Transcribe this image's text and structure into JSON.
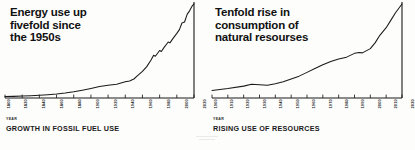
{
  "figure": {
    "background_color": "#fdfdfc",
    "ink_color": "#1a1a1a"
  },
  "chart_data": [
    {
      "type": "line",
      "id": "fossil-fuel-use",
      "title": "Energy use up\nfivefold since\nthe 1950s",
      "caption": "GROWTH IN FOSSIL FUEL USE",
      "xlabel": "YEAR",
      "ylabel": "",
      "grid": false,
      "legend": "none",
      "xlim": [
        1800,
        2020
      ],
      "ylim": [
        0,
        100
      ],
      "tick_labels": [
        "1800",
        "1820",
        "1840",
        "1860",
        "1880",
        "1900",
        "1920",
        "1940",
        "1960",
        "1980",
        "2000",
        "2020"
      ],
      "x": [
        1800,
        1810,
        1820,
        1830,
        1840,
        1850,
        1860,
        1870,
        1880,
        1890,
        1900,
        1910,
        1920,
        1930,
        1940,
        1945,
        1950,
        1955,
        1960,
        1965,
        1970,
        1973,
        1975,
        1980,
        1982,
        1985,
        1990,
        1992,
        1995,
        2000,
        2003,
        2006,
        2009,
        2012,
        2015,
        2018,
        2020
      ],
      "values": [
        1.5,
        1.7,
        2.0,
        2.4,
        2.9,
        3.5,
        4.3,
        5.3,
        6.6,
        8.2,
        10.0,
        12.0,
        13.5,
        14.5,
        17.0,
        18.0,
        20.0,
        24.0,
        28.0,
        33.0,
        40.0,
        45.0,
        44.0,
        50.0,
        49.0,
        53.0,
        59.0,
        58.0,
        62.0,
        68.0,
        72.0,
        79.0,
        80.0,
        88.0,
        92.0,
        97.0,
        99.0
      ]
    },
    {
      "type": "line",
      "id": "resource-use",
      "title": "Tenfold rise in\nconsumption of\nnatural resourses",
      "caption": "RISING USE OF RESOURCES",
      "xlabel": "YEAR",
      "ylabel": "",
      "grid": false,
      "legend": "none",
      "xlim": [
        1900,
        2020
      ],
      "ylim": [
        0,
        100
      ],
      "tick_labels": [
        "1900",
        "1910",
        "1920",
        "1930",
        "1940",
        "1950",
        "1960",
        "1970",
        "1980",
        "1990",
        "2000",
        "2010",
        "2020"
      ],
      "x": [
        1900,
        1910,
        1920,
        1925,
        1930,
        1935,
        1940,
        1945,
        1950,
        1955,
        1960,
        1965,
        1970,
        1975,
        1978,
        1980,
        1985,
        1990,
        1993,
        1995,
        2000,
        2003,
        2006,
        2010,
        2013,
        2016,
        2020
      ],
      "values": [
        8.0,
        10.0,
        12.5,
        14.5,
        14.0,
        13.5,
        15.0,
        17.0,
        20.0,
        23.0,
        27.0,
        31.0,
        35.0,
        38.5,
        40.0,
        41.0,
        43.0,
        47.0,
        48.0,
        47.5,
        52.0,
        58.0,
        66.0,
        74.0,
        82.0,
        90.0,
        99.0
      ]
    }
  ]
}
